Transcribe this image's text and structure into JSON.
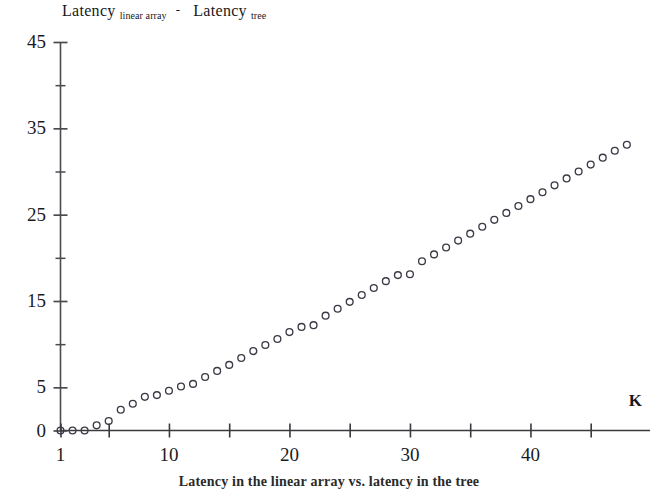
{
  "figure": {
    "title_term1": "Latency",
    "title_sub1": "linear array",
    "title_operator": "-",
    "title_term2": "Latency",
    "title_sub2": "tree",
    "caption": "Latency in the linear array vs. latency in the tree",
    "ink_color": "#1b1b1d",
    "marker_color": "#3a3a46",
    "background": "#ffffff"
  },
  "chart_data": {
    "type": "scatter",
    "xlabel": "K",
    "ylabel": "",
    "xlim": [
      1,
      49
    ],
    "ylim": [
      0,
      45
    ],
    "grid": false,
    "legend": null,
    "marker": "open-circle",
    "xticks": [
      1,
      5,
      10,
      15,
      20,
      25,
      30,
      35,
      40,
      45
    ],
    "xtick_labels": [
      "1",
      "",
      "10",
      "",
      "20",
      "",
      "30",
      "",
      "40",
      ""
    ],
    "yticks": [
      0,
      5,
      10,
      15,
      20,
      25,
      30,
      35,
      40,
      45
    ],
    "ytick_labels": [
      "0",
      "5",
      "",
      "15",
      "",
      "25",
      "",
      "35",
      "",
      "45"
    ],
    "x": [
      1,
      2,
      3,
      4,
      5,
      6,
      7,
      8,
      9,
      10,
      11,
      12,
      13,
      14,
      15,
      16,
      17,
      18,
      19,
      20,
      21,
      22,
      23,
      24,
      25,
      26,
      27,
      28,
      29,
      30,
      31,
      32,
      33,
      34,
      35,
      36,
      37,
      38,
      39,
      40,
      41,
      42,
      43,
      44,
      45,
      46,
      47,
      48
    ],
    "values": [
      0,
      0,
      0,
      0.6,
      1.1,
      2.4,
      3.1,
      3.9,
      4.1,
      4.6,
      5.1,
      5.4,
      6.2,
      6.9,
      7.6,
      8.4,
      9.2,
      9.9,
      10.6,
      11.4,
      12.0,
      12.2,
      13.3,
      14.1,
      14.9,
      15.7,
      16.5,
      17.3,
      18.0,
      18.1,
      19.6,
      20.4,
      21.2,
      22.0,
      22.8,
      23.6,
      24.4,
      25.2,
      26.0,
      26.8,
      27.6,
      28.4,
      29.2,
      30.0,
      30.8,
      31.6,
      32.4,
      33.1
    ]
  }
}
